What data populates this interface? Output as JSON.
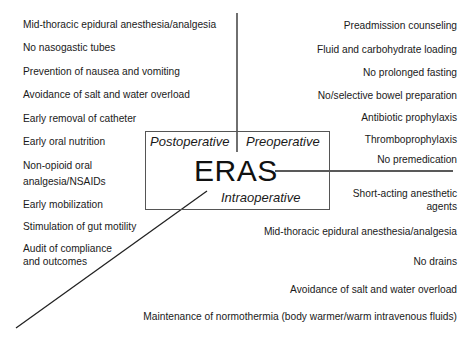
{
  "center": {
    "title": "ERAS",
    "phases": {
      "postoperative": "Postoperative",
      "preoperative": "Preoperative",
      "intraoperative": "Intraoperative"
    }
  },
  "postoperative_items": [
    "Mid-thoracic epidural anesthesia/analgesia",
    "No nasogastic tubes",
    "Prevention of nausea and vomiting",
    "Avoidance of salt and water overload",
    "Early removal of catheter",
    "Early oral nutrition",
    "Non-opioid oral",
    "analgesia/NSAIDs",
    "Early mobilization",
    "Stimulation of gut motility",
    "Audit of compliance",
    "and outcomes"
  ],
  "preoperative_items": [
    "Preadmission counseling",
    "Fluid and carbohydrate loading",
    "No prolonged fasting",
    "No/selective bowel preparation",
    "Antibiotic prophylaxis",
    "Thromboprophylaxis",
    "No premedication"
  ],
  "intraoperative_items": [
    "Short-acting anesthetic",
    "agents",
    "Mid-thoracic epidural anesthesia/analgesia",
    "No drains",
    "Avoidance of salt and water overload",
    "Maintenance of normothermia (body warmer/warm intravenous fluids)"
  ]
}
